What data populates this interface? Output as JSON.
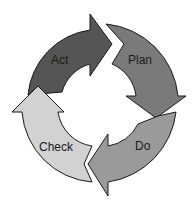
{
  "diagram": {
    "type": "cycle",
    "stages": [
      {
        "label": "Plan",
        "color": "#7a7a7a"
      },
      {
        "label": "Do",
        "color": "#9a9a9a"
      },
      {
        "label": "Check",
        "color": "#d2d2d2"
      },
      {
        "label": "Act",
        "color": "#555555"
      }
    ],
    "outline_color": "#1a1a1a"
  }
}
